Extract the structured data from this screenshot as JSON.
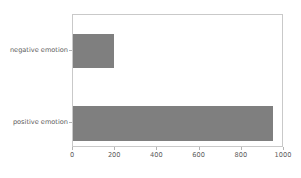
{
  "chart_data": {
    "type": "bar",
    "orientation": "horizontal",
    "title": "",
    "xlabel": "",
    "ylabel": "",
    "categories": [
      "positive emotion",
      "negative emotion"
    ],
    "values": [
      957,
      197
    ],
    "xlim": [
      0,
      1000
    ],
    "xticks": [
      0,
      200,
      400,
      600,
      800,
      1000
    ],
    "xtick_labels": [
      "0",
      "200",
      "400",
      "600",
      "800",
      "1000"
    ],
    "grid": false,
    "legend": false,
    "bar_color": "#7f7f7f",
    "axis_color": "#c9c9c9",
    "tick_label_color": "#5a5a5a",
    "background_color": "#ffffff",
    "bars": [
      {
        "label": "negative emotion",
        "value": 197,
        "color": "#7f7f7f",
        "left_px": 0,
        "top_px": 19,
        "width_px": 41.5,
        "height_px": 34
      },
      {
        "label": "positive emotion",
        "value": 957,
        "color": "#7f7f7f",
        "left_px": 0,
        "top_px": 91,
        "width_px": 202,
        "height_px": 35
      }
    ],
    "ytick_marks": [
      {
        "label": "negative emotion",
        "center_y_px": 50
      },
      {
        "label": "positive emotion",
        "center_y_px": 122
      }
    ],
    "xtick_marks": [
      {
        "label": "0",
        "x_px": 72
      },
      {
        "label": "200",
        "x_px": 114.2
      },
      {
        "label": "400",
        "x_px": 156.4
      },
      {
        "label": "600",
        "x_px": 198.6
      },
      {
        "label": "800",
        "x_px": 240.8
      },
      {
        "label": "1000",
        "x_px": 283
      }
    ]
  }
}
